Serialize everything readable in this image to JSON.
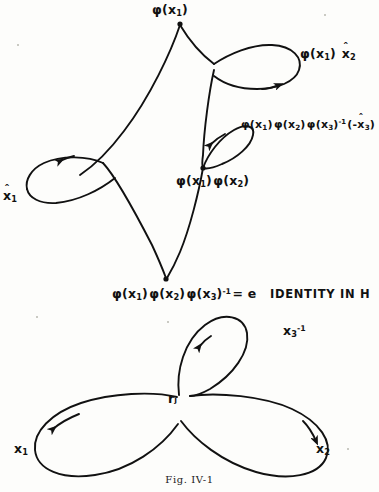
{
  "figure": {
    "caption": "Fig. IV-1",
    "ink_color": "#111111",
    "background_color": "#fdfdfb"
  },
  "top_diagram": {
    "name": "wedge-of-loops-image-under-phi",
    "labels": {
      "apex": "φ(x₁)",
      "upper_loop": "φ(x₁) x̂₂",
      "middle_loop": "φ(x₁) φ(x₂) φ(x₃)⁻¹ (-x̂₃)",
      "middle_vertex": "φ(x₁) φ(x₂)",
      "left_loop": "x̂₁",
      "bottom_vertex": "φ(x₁) φ(x₂) φ(x₃)⁻¹ = e",
      "bottom_note": "IDENTITY IN H"
    },
    "label_parts": {
      "phi": "φ",
      "x": "x",
      "one": "1",
      "two": "2",
      "three": "3",
      "inverse": "-1",
      "equals_e": "= e",
      "minus": "-",
      "hat": "ˆ"
    }
  },
  "bottom_diagram": {
    "name": "three-petal-rose-wedge",
    "labels": {
      "basepoint": "rⱼ",
      "left_petal": "x₁",
      "right_petal": "x₂",
      "top_petal": "x₃⁻¹"
    }
  }
}
